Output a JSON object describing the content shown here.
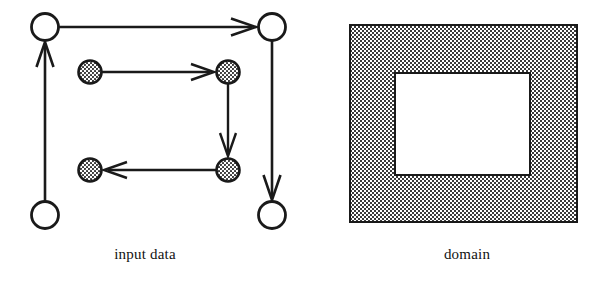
{
  "figure": {
    "background": "#ffffff",
    "ink": "#1a1a1a",
    "stipple_color": "#555555",
    "panels": [
      {
        "id": "input-data",
        "caption": "input data",
        "caption_x": 145,
        "caption_y": 246
      },
      {
        "id": "domain",
        "caption": "domain",
        "caption_x": 467,
        "caption_y": 246
      }
    ]
  },
  "diagram": {
    "type": "node-link",
    "title": "input data",
    "nodes": [
      {
        "id": "n1",
        "kind": "open",
        "cx": 45,
        "cy": 27,
        "r": 14
      },
      {
        "id": "n2",
        "kind": "open",
        "cx": 272,
        "cy": 27,
        "r": 14
      },
      {
        "id": "n3",
        "kind": "open",
        "cx": 45,
        "cy": 215,
        "r": 14
      },
      {
        "id": "n4",
        "kind": "open",
        "cx": 272,
        "cy": 215,
        "r": 14
      },
      {
        "id": "s1",
        "kind": "shaded",
        "cx": 90,
        "cy": 72,
        "r": 12
      },
      {
        "id": "s2",
        "kind": "shaded",
        "cx": 228,
        "cy": 72,
        "r": 12
      },
      {
        "id": "s3",
        "kind": "shaded",
        "cx": 90,
        "cy": 170,
        "r": 12
      },
      {
        "id": "s4",
        "kind": "shaded",
        "cx": 228,
        "cy": 170,
        "r": 12
      }
    ],
    "edges": [
      {
        "id": "e1",
        "from": "n1",
        "to": "n2",
        "direction": "right",
        "loop": "outer"
      },
      {
        "id": "e2",
        "from": "n2",
        "to": "n4",
        "direction": "down",
        "loop": "outer"
      },
      {
        "id": "e3",
        "from": "n3",
        "to": "n1",
        "direction": "up",
        "loop": "outer"
      },
      {
        "id": "e4",
        "from": "s1",
        "to": "s2",
        "direction": "right",
        "loop": "inner"
      },
      {
        "id": "e5",
        "from": "s2",
        "to": "s4",
        "direction": "down",
        "loop": "inner"
      },
      {
        "id": "e6",
        "from": "s4",
        "to": "s3",
        "direction": "left",
        "loop": "inner"
      }
    ]
  },
  "domain_shape": {
    "type": "rectangle-with-hole",
    "outer": {
      "x": 350,
      "y": 25,
      "width": 227,
      "height": 197
    },
    "inner": {
      "x": 395,
      "y": 73,
      "width": 135,
      "height": 102
    },
    "fill": "stipple-gray",
    "inner_fill": "#ffffff"
  }
}
